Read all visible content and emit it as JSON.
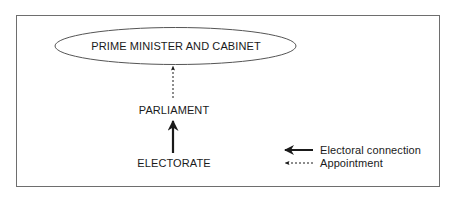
{
  "diagram": {
    "nodes": [
      {
        "id": "cabinet",
        "label": "PRIME MINISTER AND CABINET",
        "shape": "ellipse"
      },
      {
        "id": "parliament",
        "label": "PARLIAMENT",
        "shape": "text"
      },
      {
        "id": "electorate",
        "label": "ELECTORATE",
        "shape": "text"
      }
    ],
    "edges": [
      {
        "from": "electorate",
        "to": "parliament",
        "type": "electoral-connection",
        "style": "solid"
      },
      {
        "from": "parliament",
        "to": "cabinet",
        "type": "appointment",
        "style": "dashed"
      }
    ],
    "legend": {
      "items": [
        {
          "label": "Electoral connection",
          "style": "solid"
        },
        {
          "label": "Appointment",
          "style": "dashed"
        }
      ]
    },
    "colors": {
      "frame": "#6e6e6e",
      "line": "#1a1a1a",
      "text": "#1a1a1a"
    }
  }
}
